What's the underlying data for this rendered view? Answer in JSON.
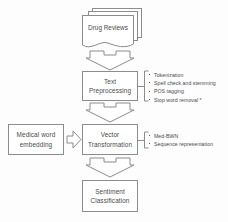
{
  "diagram": {
    "line_color": "#8c8c8c",
    "text_color": "#4a4a4a",
    "background": "#fdfdfd"
  },
  "nodes": {
    "source": {
      "label": "Drug Reviews",
      "shape": "multi-document"
    },
    "preprocessing": {
      "label": "Text\nPreprocessing",
      "shape": "rectangle"
    },
    "vector": {
      "label": "Vector\nTransformation",
      "shape": "rectangle"
    },
    "embedding": {
      "label": "Medical word\nembedding",
      "shape": "rectangle"
    },
    "sentiment": {
      "label": "Sentiment\nClassification",
      "shape": "rectangle"
    }
  },
  "annotations": {
    "preprocessing_steps": [
      "Tokenization",
      "Spell check and stemming",
      "POS tagging",
      "Stop word removal *"
    ],
    "vector_methods": [
      "Med-BWN",
      "Sequence representation"
    ]
  },
  "arrows": {
    "source_to_preprocessing": "down",
    "preprocessing_to_vector": "down",
    "embedding_to_vector": "right",
    "vector_to_sentiment": "down"
  }
}
